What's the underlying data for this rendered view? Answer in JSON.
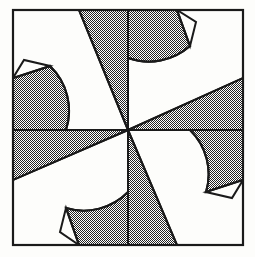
{
  "figure": {
    "title": "Eight-Pointed Star Quilt Block",
    "type": "geometric-line-drawing",
    "caption": "",
    "background_color": "#fdfdfb",
    "ink_color": "#1a1a1a",
    "shade_fill": "#6e6e6e",
    "shade_style": "50% checkerboard dither",
    "canvas": {
      "width": 255,
      "height": 257
    }
  },
  "frame": {
    "name": "outer-square-border",
    "x": 13,
    "y": 10,
    "width": 230,
    "height": 235,
    "stroke_width": 2.2
  },
  "center_point": {
    "x": 128,
    "y": 130
  },
  "geometry": {
    "description": "Eight-pointed star with pinwheel center of eight alternating wedges; four star points reach the frame edges, four reach the frame corners; shaded regions bounded by circular arcs.",
    "symmetry": "4-fold rotational (C4)",
    "arc_radius": 62,
    "point_count": 8,
    "wedge_count": 8
  },
  "shaded_regions": [
    {
      "name": "wedge-north-west",
      "fill": "#6e6e6e"
    },
    {
      "name": "wedge-north-east",
      "fill": "#6e6e6e"
    },
    {
      "name": "wedge-east-north",
      "fill": "#6e6e6e"
    },
    {
      "name": "wedge-east-south",
      "fill": "#6e6e6e"
    },
    {
      "name": "wedge-south-east",
      "fill": "#6e6e6e"
    },
    {
      "name": "wedge-south-west",
      "fill": "#6e6e6e"
    },
    {
      "name": "wedge-west-south",
      "fill": "#6e6e6e"
    },
    {
      "name": "wedge-west-north",
      "fill": "#6e6e6e"
    }
  ],
  "white_regions": [
    {
      "name": "corner-white-top-left"
    },
    {
      "name": "corner-white-top-right"
    },
    {
      "name": "corner-white-bottom-left"
    },
    {
      "name": "corner-white-bottom-right"
    },
    {
      "name": "small-white-triangle-left"
    },
    {
      "name": "small-white-triangle-top"
    },
    {
      "name": "small-white-triangle-right"
    },
    {
      "name": "small-white-triangle-bottom"
    }
  ]
}
